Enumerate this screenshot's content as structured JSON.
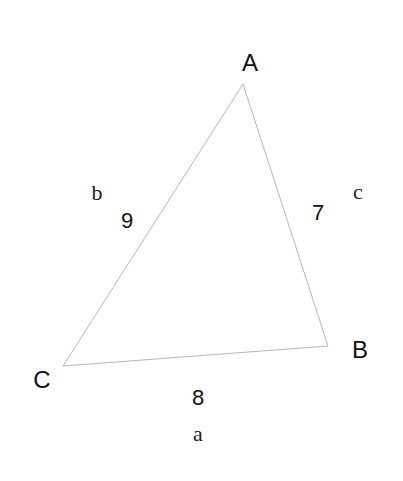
{
  "diagram": {
    "type": "triangle",
    "vertices": [
      {
        "label": "A",
        "x": 243,
        "y": 84,
        "label_x": 250,
        "label_y": 71
      },
      {
        "label": "B",
        "x": 328,
        "y": 346,
        "label_x": 360,
        "label_y": 358
      },
      {
        "label": "C",
        "x": 63,
        "y": 366,
        "label_x": 42,
        "label_y": 388
      }
    ],
    "sides": [
      {
        "name": "a",
        "from": "C",
        "to": "B",
        "length_label": "8",
        "length_x": 198,
        "length_y": 405,
        "name_x": 198,
        "name_y": 441
      },
      {
        "name": "b",
        "from": "C",
        "to": "A",
        "length_label": "9",
        "length_x": 127,
        "length_y": 228,
        "name_x": 97,
        "name_y": 200
      },
      {
        "name": "c",
        "from": "A",
        "to": "B",
        "length_label": "7",
        "length_x": 318,
        "length_y": 220,
        "name_x": 358,
        "name_y": 199
      }
    ],
    "colors": {
      "edge": "#b8b8b8",
      "text": "#111111"
    }
  }
}
